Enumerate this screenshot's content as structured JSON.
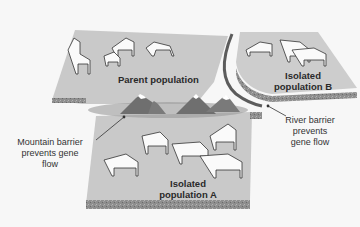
{
  "diagram": {
    "topic": "Geographic isolation (allopatric speciation)",
    "regions": [
      {
        "id": "parent",
        "label": "Parent population",
        "horse_count": 5
      },
      {
        "id": "isolated_b",
        "label_line1": "Isolated",
        "label_line2": "population B",
        "horse_count": 3
      },
      {
        "id": "isolated_a",
        "label_line1": "Isolated",
        "label_line2": "population A",
        "horse_count": 5
      }
    ],
    "barriers": [
      {
        "id": "mountain",
        "note_line1": "Mountain barrier",
        "note_line2": "prevents gene",
        "note_line3": "flow"
      },
      {
        "id": "river",
        "note_line1": "River barrier",
        "note_line2": "prevents",
        "note_line3": "gene flow"
      }
    ],
    "colors": {
      "platform_top": "#c9c9c9",
      "platform_side": "#8e8e8e",
      "mountain": "#6f6f6f",
      "snow": "#ffffff",
      "river": "#f2f2f2",
      "leader_line": "#333333"
    }
  }
}
